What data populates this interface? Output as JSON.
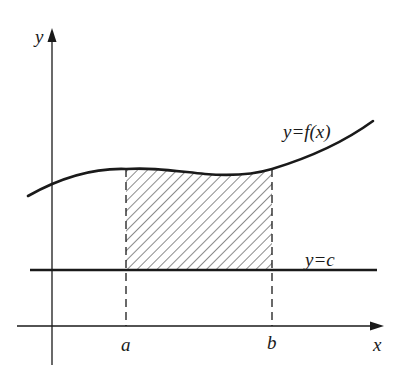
{
  "diagram": {
    "type": "definite-integral-area-illustration",
    "colors": {
      "ink": "#1a1a1a",
      "background": "#ffffff"
    },
    "axes": {
      "x_label": "x",
      "y_label": "y"
    },
    "curves": [
      {
        "id": "f",
        "label": "y=f(x)"
      },
      {
        "id": "c",
        "label": "y=c"
      }
    ],
    "bounds": {
      "a_label": "a",
      "b_label": "b"
    },
    "shaded_region": {
      "description": "hatched region between y=c and y=f(x) from x=a to x=b",
      "pattern": "diagonal-hatch"
    }
  }
}
